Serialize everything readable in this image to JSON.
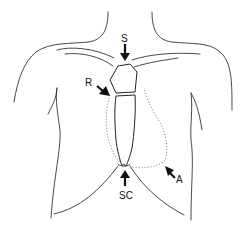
{
  "diagram": {
    "labels": {
      "suprasternal": "S",
      "right_parasternal": "R",
      "subcostal": "SC",
      "apical": "A"
    },
    "colors": {
      "line": "#333333",
      "arrow": "#111111",
      "dotted": "#666666",
      "background": "#ffffff"
    }
  }
}
